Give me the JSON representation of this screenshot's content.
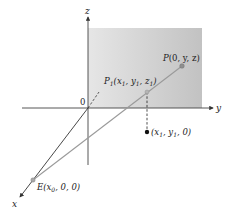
{
  "diagram": {
    "type": "3d-coordinate-perspective-projection",
    "axes": {
      "x_label": "x",
      "y_label": "y",
      "z_label": "z",
      "origin_label": "0"
    },
    "plane": {
      "description": "yz-plane (shaded)",
      "fill_light": "#e6e6e6",
      "fill_dark": "#c2c2c2"
    },
    "points": {
      "P": {
        "name": "P",
        "coords": "(0, y, z)"
      },
      "P1": {
        "name": "P",
        "subscript": "1",
        "coords_parts": [
          "(x",
          "1",
          ", y",
          "1",
          ", z",
          "1",
          ")"
        ]
      },
      "foot": {
        "coords_parts": [
          "(x",
          "1",
          ", y",
          "1",
          ", 0)"
        ]
      },
      "E": {
        "name": "E",
        "coords_parts": [
          "(x",
          "0",
          ", 0, 0)"
        ]
      }
    },
    "colors": {
      "axis": "#333333",
      "ray": "#9a9a9a",
      "point_gray": "#8f8f8f",
      "point_dark": "#111111"
    }
  }
}
